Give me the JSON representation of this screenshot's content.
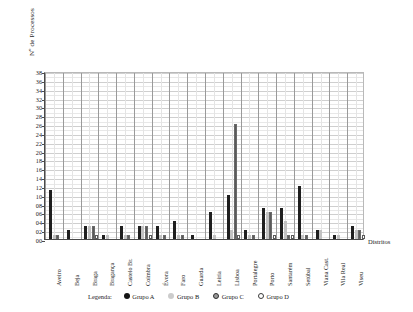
{
  "chart_data": {
    "type": "bar",
    "title": "",
    "xlabel": "Distritos",
    "ylabel": "Nº de Processos",
    "ylim": [
      0,
      38
    ],
    "ytick_step": 2,
    "grid": true,
    "legend_position": "bottom",
    "legend_title": "Legenda:",
    "ytick_labels": [
      "00",
      "02",
      "04",
      "06",
      "08",
      "10",
      "12",
      "14",
      "16",
      "18",
      "20",
      "22",
      "24",
      "26",
      "28",
      "30",
      "32",
      "34",
      "36",
      "38"
    ],
    "categories": [
      "Aveiro",
      "Beja",
      "Braga",
      "Bragança",
      "Castelo Br.",
      "Coimbra",
      "Évora",
      "Faro",
      "Guarda",
      "Leiria",
      "Lisboa",
      "Portalegre",
      "Porto",
      "Santarém",
      "Setúbal",
      "Viana Cast.",
      "Vila Real",
      "Viseu"
    ],
    "series": [
      {
        "name": "Grupo A",
        "color": "#1f1f1f",
        "values": [
          11,
          2,
          3,
          1,
          3,
          3,
          3,
          4,
          1,
          6,
          10,
          2,
          7,
          7,
          12,
          2,
          1,
          3
        ]
      },
      {
        "name": "Grupo B",
        "color": "#c2c2c2",
        "values": [
          1,
          0,
          3,
          1,
          1,
          3,
          1,
          1,
          0,
          1,
          2,
          1,
          6,
          4,
          1,
          2,
          1,
          2
        ]
      },
      {
        "name": "Grupo C",
        "color": "#9a9a9a",
        "values": [
          1,
          0,
          3,
          0,
          1,
          3,
          1,
          1,
          0,
          0,
          26,
          1,
          6,
          1,
          1,
          0,
          0,
          2
        ]
      },
      {
        "name": "Grupo D",
        "color": "#ffffff",
        "values": [
          0,
          0,
          1,
          0,
          0,
          1,
          0,
          0,
          0,
          0,
          1,
          0,
          1,
          1,
          0,
          0,
          0,
          1
        ]
      }
    ]
  }
}
